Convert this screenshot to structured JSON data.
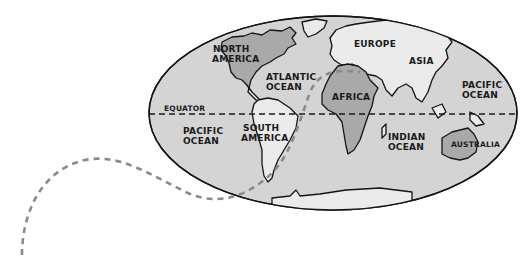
{
  "map": {
    "projection": "oval world map",
    "colors": {
      "ocean": "#d4d4d4",
      "land_light": "#ebebeb",
      "land_highlight": "#a9a9a9",
      "outline": "#141414",
      "route_dash": "#8a8a8a",
      "equator_dash": "#1a1a1a",
      "background": "#ffffff"
    },
    "labels": {
      "north_america": [
        "NORTH",
        "AMERICA"
      ],
      "south_america": [
        "SOUTH",
        "AMERICA"
      ],
      "europe": "EUROPE",
      "asia": "ASIA",
      "africa": "AFRICA",
      "australia": "AUSTRALIA",
      "atlantic_ocean": [
        "ATLANTIC",
        "OCEAN"
      ],
      "pacific_ocean_west": [
        "PACIFIC",
        "OCEAN"
      ],
      "pacific_ocean_east": [
        "PACIFIC",
        "OCEAN"
      ],
      "indian_ocean": [
        "INDIAN",
        "OCEAN"
      ],
      "equator": "EQUATOR"
    },
    "highlighted_regions": [
      "North America",
      "Africa",
      "Australia"
    ],
    "route": "dashed grey path entering from lower-left, crossing South Atlantic toward North Africa"
  }
}
